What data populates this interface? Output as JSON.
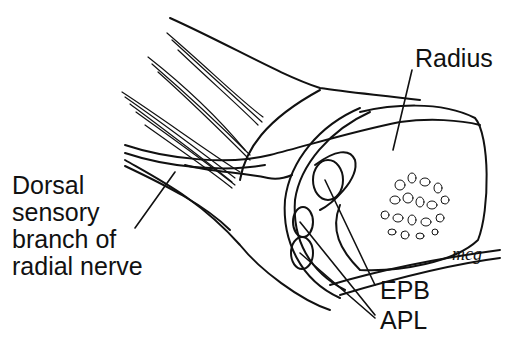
{
  "figure": {
    "type": "anatomical line drawing",
    "labels": {
      "radius": "Radius",
      "nerve_line1": "Dorsal",
      "nerve_line2": "sensory",
      "nerve_line3": "branch of",
      "nerve_line4": "radial nerve",
      "epb": "EPB",
      "apl": "APL"
    },
    "signature": "mcg",
    "colors": {
      "ink": "#111111",
      "background": "#ffffff"
    }
  }
}
